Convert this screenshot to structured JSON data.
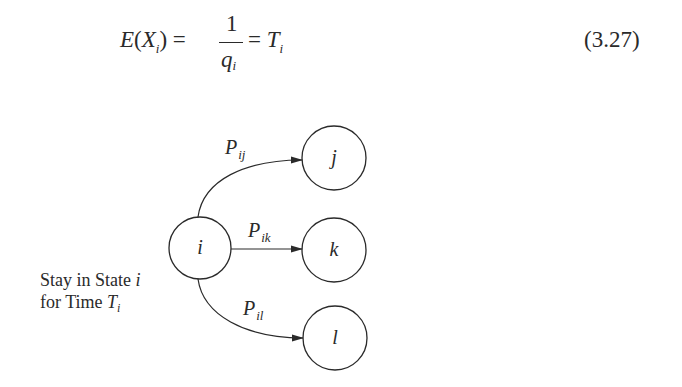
{
  "equation": {
    "lhs_func": "E",
    "lhs_open": "(",
    "lhs_var": "X",
    "lhs_sub": "i",
    "lhs_close": ")",
    "eq1": "=",
    "numerator": "1",
    "denominator_var": "q",
    "denominator_sub": "i",
    "eq2": "=",
    "rhs_var": "T",
    "rhs_sub": "i",
    "number": "(3.27)"
  },
  "diagram": {
    "nodes": [
      {
        "id": "i",
        "label": "i",
        "cx": 200,
        "cy": 248,
        "r": 31
      },
      {
        "id": "j",
        "label": "j",
        "cx": 334,
        "cy": 158,
        "r": 32
      },
      {
        "id": "k",
        "label": "k",
        "cx": 334,
        "cy": 250,
        "r": 32
      },
      {
        "id": "l",
        "label": "l",
        "cx": 335,
        "cy": 338,
        "r": 32
      }
    ],
    "edges": [
      {
        "from": "i",
        "to": "j",
        "label_main": "P",
        "label_sub": "ij"
      },
      {
        "from": "i",
        "to": "k",
        "label_main": "P",
        "label_sub": "ik"
      },
      {
        "from": "i",
        "to": "l",
        "label_main": "P",
        "label_sub": "il"
      }
    ],
    "caption_line1_text": "Stay in State ",
    "caption_line1_var": "i",
    "caption_line2_text": "for Time ",
    "caption_line2_var": "T",
    "caption_line2_sub": "i"
  },
  "colors": {
    "ink": "#2a2a2a",
    "background": "#ffffff"
  }
}
